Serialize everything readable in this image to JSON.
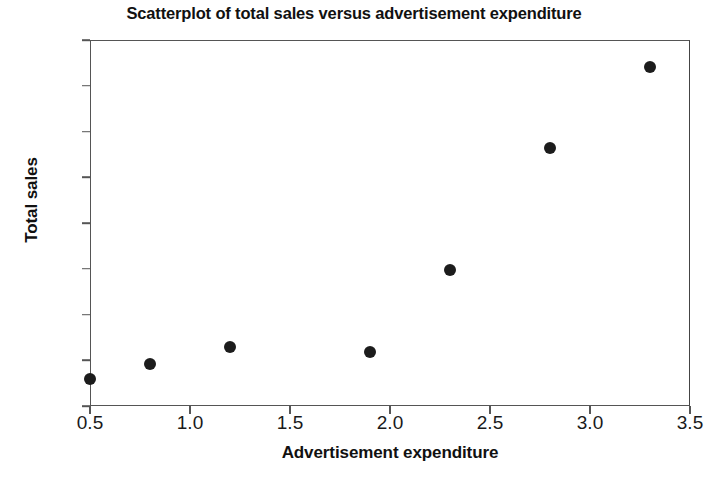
{
  "chart_data": {
    "type": "scatter",
    "title": "Scatterplot of total sales versus advertisement expenditure",
    "xlabel": "Advertisement expenditure",
    "ylabel": "Total sales",
    "xlim": [
      0.5,
      3.5
    ],
    "ylim": [
      100,
      900
    ],
    "xticks": [
      "0.5",
      "1.0",
      "1.5",
      "2.0",
      "2.5",
      "3.0",
      "3.5"
    ],
    "xtick_values": [
      0.5,
      1.0,
      1.5,
      2.0,
      2.5,
      3.0,
      3.5
    ],
    "yticks": [
      "100",
      "200",
      "300",
      "400",
      "500",
      "600",
      "700",
      "800",
      "900"
    ],
    "ytick_values": [
      100,
      200,
      300,
      400,
      500,
      600,
      700,
      800,
      900
    ],
    "grid": false,
    "legend": null,
    "marker_color": "#1c1c1c",
    "marker_size_px": 12,
    "frame_color": "#555555",
    "background_color": "#ffffff",
    "points": [
      {
        "x": 0.5,
        "y": 160
      },
      {
        "x": 0.8,
        "y": 192
      },
      {
        "x": 1.2,
        "y": 230
      },
      {
        "x": 1.9,
        "y": 218
      },
      {
        "x": 2.3,
        "y": 397
      },
      {
        "x": 2.8,
        "y": 665
      },
      {
        "x": 3.3,
        "y": 840
      }
    ]
  }
}
